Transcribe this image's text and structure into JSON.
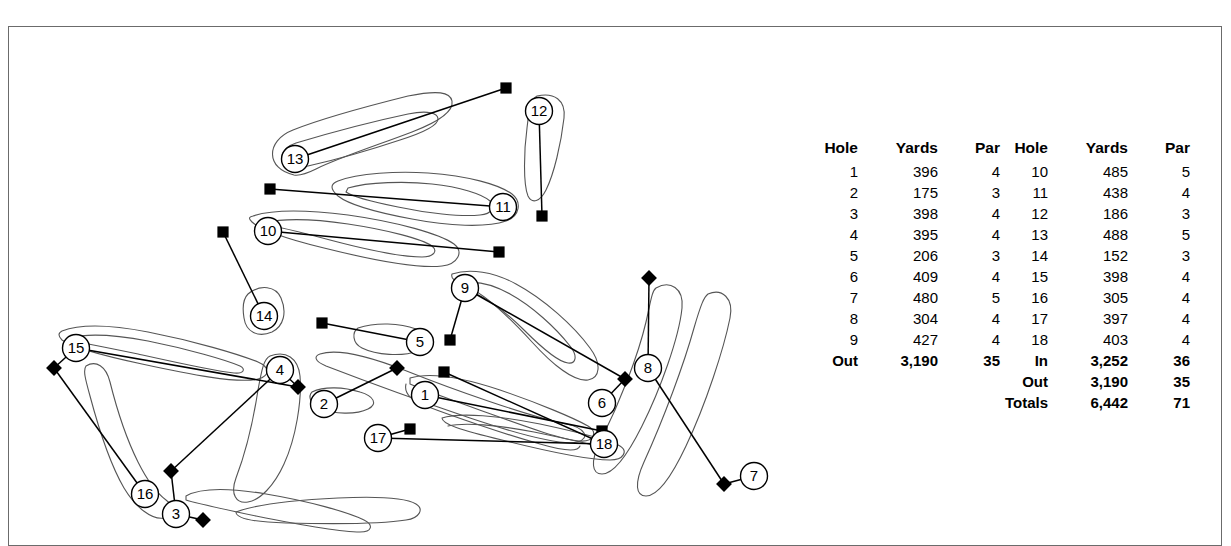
{
  "scorecard": {
    "front": {
      "headers": {
        "hole": "Hole",
        "yards": "Yards",
        "par": "Par"
      },
      "rows": [
        {
          "hole": "1",
          "yards": "396",
          "par": "4"
        },
        {
          "hole": "2",
          "yards": "175",
          "par": "3"
        },
        {
          "hole": "3",
          "yards": "398",
          "par": "4"
        },
        {
          "hole": "4",
          "yards": "395",
          "par": "4"
        },
        {
          "hole": "5",
          "yards": "206",
          "par": "3"
        },
        {
          "hole": "6",
          "yards": "409",
          "par": "4"
        },
        {
          "hole": "7",
          "yards": "480",
          "par": "5"
        },
        {
          "hole": "8",
          "yards": "304",
          "par": "4"
        },
        {
          "hole": "9",
          "yards": "427",
          "par": "4"
        }
      ],
      "summary": [
        {
          "hole": "Out",
          "yards": "3,190",
          "par": "35"
        }
      ]
    },
    "back": {
      "headers": {
        "hole": "Hole",
        "yards": "Yards",
        "par": "Par"
      },
      "rows": [
        {
          "hole": "10",
          "yards": "485",
          "par": "5"
        },
        {
          "hole": "11",
          "yards": "438",
          "par": "4"
        },
        {
          "hole": "12",
          "yards": "186",
          "par": "3"
        },
        {
          "hole": "13",
          "yards": "488",
          "par": "5"
        },
        {
          "hole": "14",
          "yards": "152",
          "par": "3"
        },
        {
          "hole": "15",
          "yards": "398",
          "par": "4"
        },
        {
          "hole": "16",
          "yards": "305",
          "par": "4"
        },
        {
          "hole": "17",
          "yards": "397",
          "par": "4"
        },
        {
          "hole": "18",
          "yards": "403",
          "par": "4"
        }
      ],
      "summary": [
        {
          "hole": "In",
          "yards": "3,252",
          "par": "36"
        },
        {
          "hole": "Out",
          "yards": "3,190",
          "par": "35"
        },
        {
          "hole": "Totals",
          "yards": "6,442",
          "par": "71"
        }
      ]
    }
  },
  "map": {
    "green_markers": [
      {
        "hole": "1",
        "x": 417,
        "y": 369
      },
      {
        "hole": "2",
        "x": 316,
        "y": 378
      },
      {
        "hole": "3",
        "x": 168,
        "y": 488
      },
      {
        "hole": "4",
        "x": 272,
        "y": 344
      },
      {
        "hole": "5",
        "x": 412,
        "y": 316
      },
      {
        "hole": "6",
        "x": 594,
        "y": 377
      },
      {
        "hole": "7",
        "x": 746,
        "y": 450
      },
      {
        "hole": "8",
        "x": 640,
        "y": 342
      },
      {
        "hole": "9",
        "x": 457,
        "y": 262
      },
      {
        "hole": "10",
        "x": 260,
        "y": 205
      },
      {
        "hole": "11",
        "x": 495,
        "y": 181
      },
      {
        "hole": "12",
        "x": 531,
        "y": 85
      },
      {
        "hole": "13",
        "x": 287,
        "y": 133
      },
      {
        "hole": "14",
        "x": 256,
        "y": 290
      },
      {
        "hole": "15",
        "x": 68,
        "y": 322
      },
      {
        "hole": "16",
        "x": 137,
        "y": 468
      },
      {
        "hole": "17",
        "x": 370,
        "y": 412
      },
      {
        "hole": "18",
        "x": 596,
        "y": 418
      }
    ],
    "tee_markers": [
      {
        "hole": "13",
        "x": 498,
        "y": 62,
        "shape": "square"
      },
      {
        "hole": "12",
        "x": 534,
        "y": 190,
        "shape": "square"
      },
      {
        "hole": "11",
        "x": 262,
        "y": 163,
        "shape": "square"
      },
      {
        "hole": "10",
        "x": 491,
        "y": 226,
        "shape": "square"
      },
      {
        "hole": "14",
        "x": 215,
        "y": 206,
        "shape": "square"
      },
      {
        "hole": "15",
        "x": 46,
        "y": 342,
        "shape": "diamond"
      },
      {
        "hole": "16",
        "x": 195,
        "y": 494,
        "shape": "diamond"
      },
      {
        "hole": "4",
        "x": 290,
        "y": 361,
        "shape": "diamond"
      },
      {
        "hole": "3",
        "x": 163,
        "y": 445,
        "shape": "diamond"
      },
      {
        "hole": "2",
        "x": 389,
        "y": 342,
        "shape": "diamond"
      },
      {
        "hole": "5",
        "x": 314,
        "y": 297,
        "shape": "square"
      },
      {
        "hole": "17",
        "x": 402,
        "y": 403,
        "shape": "square"
      },
      {
        "hole": "1",
        "x": 594,
        "y": 405,
        "shape": "square"
      },
      {
        "hole": "9",
        "x": 442,
        "y": 314,
        "shape": "square"
      },
      {
        "hole": "6",
        "x": 617,
        "y": 353,
        "shape": "diamond"
      },
      {
        "hole": "8",
        "x": 641,
        "y": 252,
        "shape": "diamond"
      },
      {
        "hole": "7",
        "x": 716,
        "y": 458,
        "shape": "diamond"
      },
      {
        "hole": "18",
        "x": 436,
        "y": 346,
        "shape": "square"
      }
    ]
  },
  "colors": {
    "frame": "#6b6b6b",
    "ink": "#000000",
    "fairway_outline": "#555555",
    "background": "#ffffff"
  }
}
